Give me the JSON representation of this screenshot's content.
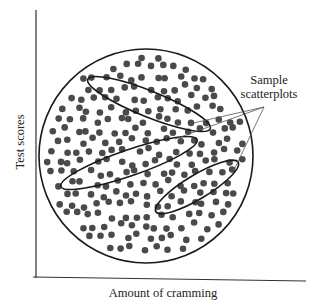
{
  "figure": {
    "x_axis_label": "Amount of cramming",
    "y_axis_label": "Test scores",
    "annotation": {
      "line1": "Sample",
      "line2": "scatterplots"
    },
    "colors": {
      "dot": "#4a4a4a",
      "outline": "#1a1a1a",
      "axis": "#333333",
      "pointer": "#555555"
    }
  },
  "chart_data": {
    "type": "scatter",
    "title": "",
    "xlabel": "Amount of cramming",
    "ylabel": "Test scores",
    "population_shape": "circle",
    "population_point_count_approx": 230,
    "samples": [
      {
        "name": "sample-1",
        "apparent_trend": "negative"
      },
      {
        "name": "sample-2",
        "apparent_trend": "positive"
      },
      {
        "name": "sample-3",
        "apparent_trend": "positive"
      }
    ],
    "annotation": "Sample scatterplots",
    "grid": false,
    "ticks": false
  }
}
